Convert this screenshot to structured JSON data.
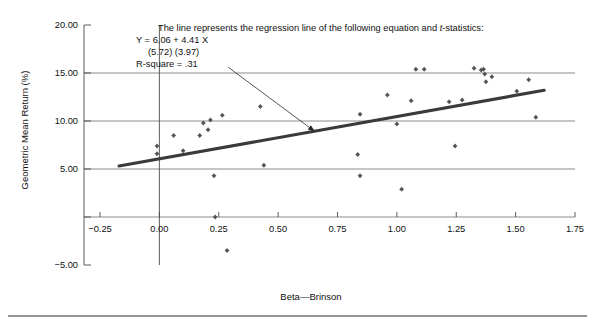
{
  "figure": {
    "background": "#ffffff",
    "marker_color": "#545454",
    "line_color": "#3a3a3a",
    "grid_color": "#6f6f6f",
    "axis_color": "#4a4a4a"
  },
  "annotation": {
    "line1_prefix": "The line represents the regression line of the following equation and ",
    "line1_italic": "t",
    "line1_suffix": "-statistics:",
    "line2": "Y =  6.06  + 4.41 X",
    "line3": "(5.72)   (3.97)",
    "line4": "R-square = .31"
  },
  "footer": {
    "rule": true
  },
  "chart_data": {
    "type": "scatter",
    "title": "",
    "xlabel": "Beta—Brinson",
    "ylabel": "Geometric Mean Return (%)",
    "xlim": [
      -0.25,
      1.75
    ],
    "ylim": [
      -5.0,
      20.0
    ],
    "xticks": [
      -0.25,
      0.0,
      0.25,
      0.5,
      0.75,
      1.0,
      1.25,
      1.5,
      1.75
    ],
    "xticklabels": [
      "−0.25",
      "0.00",
      "0.25",
      "0.50",
      "0.75",
      "1.00",
      "1.25",
      "1.50",
      "1.75"
    ],
    "yticks": [
      -5.0,
      0.0,
      5.0,
      10.0,
      15.0,
      20.0
    ],
    "yticklabels": [
      "−5.00",
      "",
      "5.00",
      "10.00",
      "15.00",
      "20.00"
    ],
    "gridlines_y": [
      0.0,
      5.0,
      10.0,
      15.0
    ],
    "grid": true,
    "legend": null,
    "regression": {
      "intercept": 6.06,
      "slope": 4.41,
      "t_intercept": 5.72,
      "t_slope": 3.97,
      "r_square": 0.31,
      "x_start": -0.17,
      "x_end": 1.62,
      "equation": "Y = 6.06 + 4.41 X"
    },
    "annotation_arrow": {
      "from_x": 0.29,
      "from_y": 15.6,
      "to_x": 0.655,
      "to_y": 8.9
    },
    "points": [
      {
        "x": -0.01,
        "y": 7.4
      },
      {
        "x": -0.01,
        "y": 6.6
      },
      {
        "x": 0.06,
        "y": 8.5
      },
      {
        "x": 0.1,
        "y": 6.9
      },
      {
        "x": 0.17,
        "y": 8.5
      },
      {
        "x": 0.185,
        "y": 9.8
      },
      {
        "x": 0.205,
        "y": 9.1
      },
      {
        "x": 0.215,
        "y": 10.1
      },
      {
        "x": 0.235,
        "y": 0.0
      },
      {
        "x": 0.23,
        "y": 4.3
      },
      {
        "x": 0.265,
        "y": 10.6
      },
      {
        "x": 0.285,
        "y": -3.5
      },
      {
        "x": 0.425,
        "y": 11.5
      },
      {
        "x": 0.44,
        "y": 5.4
      },
      {
        "x": 0.835,
        "y": 6.5
      },
      {
        "x": 0.845,
        "y": 10.7
      },
      {
        "x": 0.845,
        "y": 4.3
      },
      {
        "x": 0.96,
        "y": 12.7
      },
      {
        "x": 1.0,
        "y": 9.7
      },
      {
        "x": 1.02,
        "y": 2.9
      },
      {
        "x": 1.06,
        "y": 12.1
      },
      {
        "x": 1.08,
        "y": 15.4
      },
      {
        "x": 1.115,
        "y": 15.4
      },
      {
        "x": 1.22,
        "y": 12.0
      },
      {
        "x": 1.245,
        "y": 7.4
      },
      {
        "x": 1.275,
        "y": 12.2
      },
      {
        "x": 1.325,
        "y": 15.5
      },
      {
        "x": 1.355,
        "y": 15.3
      },
      {
        "x": 1.365,
        "y": 15.4
      },
      {
        "x": 1.37,
        "y": 14.9
      },
      {
        "x": 1.375,
        "y": 14.1
      },
      {
        "x": 1.4,
        "y": 14.6
      },
      {
        "x": 1.505,
        "y": 13.1
      },
      {
        "x": 1.555,
        "y": 14.3
      },
      {
        "x": 1.585,
        "y": 10.4
      }
    ]
  }
}
